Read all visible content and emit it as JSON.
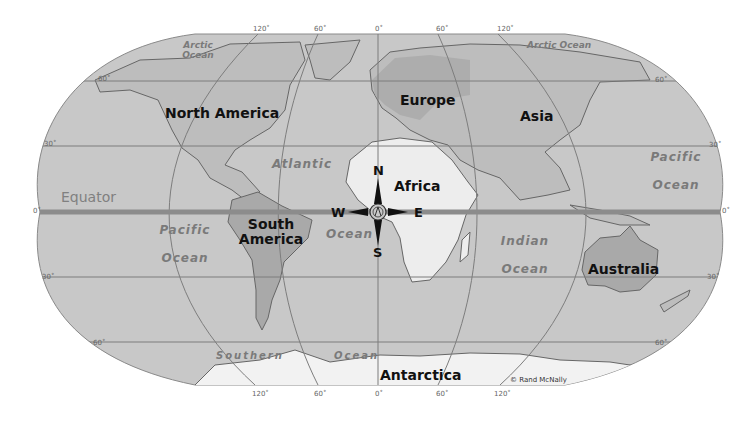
{
  "map": {
    "type": "world-map",
    "projection": "Robinson-style oval",
    "colors": {
      "ocean": "#c8c8c8",
      "land": "#bdbdbd",
      "highlight_land": "#a9a9a9",
      "africa": "#ededed",
      "antarctica": "#f2f2f2",
      "grid": "#7d7d7d",
      "equator": "#8c8c8c",
      "coast": "#666666"
    },
    "continents": [
      {
        "id": "north-america",
        "label": "North America"
      },
      {
        "id": "south-america",
        "label": "South America"
      },
      {
        "id": "europe",
        "label": "Europe"
      },
      {
        "id": "asia",
        "label": "Asia"
      },
      {
        "id": "africa",
        "label": "Africa"
      },
      {
        "id": "australia",
        "label": "Australia"
      },
      {
        "id": "antarctica",
        "label": "Antarctica"
      }
    ],
    "oceans": {
      "arctic_left": "Arctic Ocean",
      "arctic_right": "Arctic Ocean",
      "atlantic_top": "Atlantic",
      "atlantic_bottom": "Ocean",
      "pacific_left": "Pacific Ocean",
      "pacific_right": "Pacific Ocean",
      "indian": "Indian Ocean",
      "southern_left": "Southern",
      "southern_right": "Ocean"
    },
    "equator_label": "Equator",
    "compass": {
      "n": "N",
      "s": "S",
      "e": "E",
      "w": "W"
    },
    "latitude_ticks": {
      "left": [
        "60˚",
        "30˚",
        "0˚",
        "30˚",
        "60˚"
      ],
      "right": [
        "60˚",
        "30˚",
        "0˚",
        "30˚",
        "60˚"
      ]
    },
    "longitude_ticks_top": [
      "120˚",
      "60˚",
      "0˚",
      "60˚",
      "120˚"
    ],
    "longitude_ticks_bottom": [
      "120˚",
      "60˚",
      "0˚",
      "60˚",
      "120˚"
    ],
    "credit": "© Rand McNally"
  }
}
